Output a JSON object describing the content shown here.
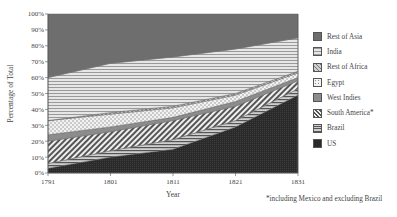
{
  "chart_data": {
    "type": "area",
    "stacked": true,
    "title": "",
    "xlabel": "Year",
    "ylabel": "Percentage of Total",
    "x": [
      1791,
      1801,
      1811,
      1821,
      1831
    ],
    "x_ticks": [
      "1791",
      "1801",
      "1811",
      "1821",
      "1831"
    ],
    "y_ticks": [
      "0%",
      "10%",
      "20%",
      "30%",
      "40%",
      "50%",
      "60%",
      "70%",
      "80%",
      "90%",
      "100%"
    ],
    "ylim": [
      0,
      100
    ],
    "grid": false,
    "legend_position": "right",
    "series": [
      {
        "name": "US",
        "values": [
          3,
          10,
          15,
          29,
          49
        ]
      },
      {
        "name": "Brazil",
        "values": [
          3,
          4,
          6,
          4,
          4
        ]
      },
      {
        "name": "South America*",
        "values": [
          14,
          12,
          12,
          9,
          5
        ]
      },
      {
        "name": "West Indies",
        "values": [
          4,
          3,
          2,
          3,
          2
        ]
      },
      {
        "name": "Egypt",
        "values": [
          9,
          8,
          6,
          4,
          3
        ]
      },
      {
        "name": "Rest of Africa",
        "values": [
          0,
          1,
          1,
          1,
          1
        ]
      },
      {
        "name": "India",
        "values": [
          27,
          31,
          31,
          28,
          21
        ]
      },
      {
        "name": "Rest of Asia",
        "values": [
          40,
          31,
          27,
          22,
          15
        ]
      }
    ],
    "legend_order": [
      "Rest of Asia",
      "India",
      "Rest of Africa",
      "Egypt",
      "West Indies",
      "South America*",
      "Brazil",
      "US"
    ],
    "annotations": [
      "*including Mexico and excluding Brazil"
    ]
  },
  "legend": {
    "items": [
      {
        "label": "Rest of Asia"
      },
      {
        "label": "India"
      },
      {
        "label": "Rest of Africa"
      },
      {
        "label": "Egypt"
      },
      {
        "label": "West Indies"
      },
      {
        "label": "South America*"
      },
      {
        "label": "Brazil"
      },
      {
        "label": "US"
      }
    ]
  },
  "footnote": "*including Mexico and excluding Brazil",
  "colors": {
    "rest_of_asia": "#6e6e6e",
    "us": "#2e2e2e",
    "west_indies": "#8c8c8c",
    "line": "#666666"
  }
}
